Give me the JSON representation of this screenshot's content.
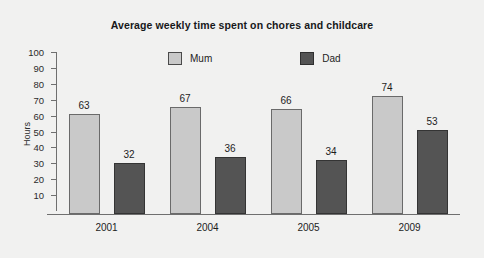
{
  "chart_data": {
    "type": "bar",
    "title": "Average weekly time spent on chores and childcare",
    "xlabel": "",
    "ylabel": "Hours",
    "categories": [
      "2001",
      "2004",
      "2005",
      "2009"
    ],
    "series": [
      {
        "name": "Mum",
        "values": [
          63,
          67,
          66,
          74
        ],
        "color": "#c9c9c9"
      },
      {
        "name": "Dad",
        "values": [
          32,
          36,
          34,
          53
        ],
        "color": "#545454"
      }
    ],
    "yticks": [
      100,
      90,
      80,
      70,
      60,
      50,
      40,
      30,
      20,
      10
    ],
    "ylim": [
      0,
      100
    ],
    "grid": false,
    "legend_position": "top-center",
    "data_labels": true
  },
  "colors": {
    "background": "#f1f1f0",
    "axis": "#6f6f6f",
    "text": "#1d1d1d",
    "mum": "#c9c9c9",
    "dad": "#545454"
  }
}
